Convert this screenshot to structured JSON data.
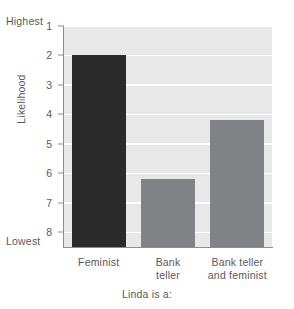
{
  "chart_data": {
    "type": "bar",
    "title": "",
    "categories": [
      "Feminist",
      "Bank\nteller",
      "Bank teller\nand feminist"
    ],
    "values": [
      2.0,
      6.2,
      4.2
    ],
    "series": [
      {
        "name": "Likelihood rating",
        "values": [
          2.0,
          6.2,
          4.2
        ]
      }
    ],
    "xlabel": "Linda is a:",
    "ylabel": "Likelihood",
    "ylim": [
      1,
      8.5
    ],
    "y_inverted": true,
    "y_ticks": [
      1,
      2,
      3,
      4,
      5,
      6,
      7,
      8
    ],
    "y_tick_labels": [
      "1",
      "2",
      "3",
      "4",
      "5",
      "6",
      "7",
      "8"
    ],
    "y_axis_top_annotation": "Highest",
    "y_axis_bottom_annotation": "Lowest",
    "grid": true,
    "grid_color": "#ffffff",
    "legend": false,
    "legend_position": "none",
    "plot_background": "#e8e8e8",
    "bar_colors": [
      "#2b2b2b",
      "#808285",
      "#808285"
    ],
    "axis_color": "#8b8c8e",
    "text_color": "#58595b"
  },
  "axis": {
    "highest": "Highest",
    "lowest": "Lowest",
    "ylabel": "Likelihood",
    "xlabel": "Linda is a:"
  },
  "bars": [
    {
      "label": "Feminist",
      "label_line1": "Feminist",
      "label_line2": "",
      "value": 2.0,
      "color": "#2b2b2b"
    },
    {
      "label": "Bank teller",
      "label_line1": "Bank",
      "label_line2": "teller",
      "value": 6.2,
      "color": "#808285"
    },
    {
      "label": "Bank teller and feminist",
      "label_line1": "Bank teller",
      "label_line2": "and feminist",
      "value": 4.2,
      "color": "#808285"
    }
  ]
}
